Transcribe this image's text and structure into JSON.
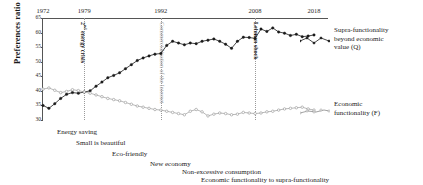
{
  "chart_data": {
    "type": "line",
    "title": "",
    "xlabel": "",
    "ylabel": "Preferences ratio (%)",
    "ylim": [
      30,
      65
    ],
    "xlim": [
      1972,
      2018
    ],
    "grid": false,
    "legend_position": "right",
    "yticks": [
      "65",
      "60",
      "55",
      "50",
      "45",
      "40",
      "35",
      "30"
    ],
    "ytick_values": [
      65,
      60,
      55,
      50,
      45,
      40,
      35,
      30
    ],
    "xticks": [
      "1972",
      "1979",
      "1992",
      "2008",
      "2018"
    ],
    "xtick_values": [
      1972,
      1979,
      1992,
      2008,
      2018
    ],
    "series": [
      {
        "name": "Supra-functionality beyond economic value (Q)",
        "symbol": "Q",
        "marker": "filled-circle",
        "color": "#1a1a1a",
        "x": [
          1972,
          1973,
          1974,
          1975,
          1976,
          1977,
          1978,
          1979,
          1980,
          1981,
          1982,
          1983,
          1984,
          1985,
          1986,
          1987,
          1988,
          1989,
          1990,
          1991,
          1992,
          1993,
          1994,
          1995,
          1996,
          1997,
          1998,
          1999,
          2000,
          2001,
          2002,
          2003,
          2004,
          2005,
          2006,
          2007,
          2008,
          2009,
          2010,
          2011,
          2012,
          2013,
          2014,
          2015,
          2016,
          2017,
          2018
        ],
        "values": [
          35.0,
          34.0,
          35.6,
          37.4,
          38.8,
          39.4,
          39.2,
          39.6,
          40.0,
          41.6,
          43.0,
          44.5,
          45.3,
          46.2,
          47.6,
          49.0,
          50.4,
          51.3,
          52.0,
          52.6,
          52.8,
          55.6,
          57.0,
          56.4,
          55.8,
          56.4,
          56.2,
          57.0,
          57.4,
          57.8,
          57.0,
          56.0,
          54.6,
          57.0,
          58.4,
          58.3,
          58.0,
          61.2,
          60.4,
          61.6,
          60.2,
          59.8,
          59.0,
          59.4,
          58.6,
          58.8,
          59.2
        ]
      },
      {
        "name": "Economic functionality (F)",
        "symbol": "F",
        "marker": "open-circle",
        "color": "#8a8a8a",
        "x": [
          1972,
          1973,
          1974,
          1975,
          1976,
          1977,
          1978,
          1979,
          1980,
          1981,
          1982,
          1983,
          1984,
          1985,
          1986,
          1987,
          1988,
          1989,
          1990,
          1991,
          1992,
          1993,
          1994,
          1995,
          1996,
          1997,
          1998,
          1999,
          2000,
          2001,
          2002,
          2003,
          2004,
          2005,
          2006,
          2007,
          2008,
          2009,
          2010,
          2011,
          2012,
          2013,
          2014,
          2015,
          2016,
          2017,
          2018
        ],
        "values": [
          40.6,
          41.0,
          40.2,
          39.4,
          39.8,
          40.4,
          40.1,
          39.6,
          39.2,
          38.6,
          38.0,
          37.4,
          37.0,
          36.6,
          36.0,
          35.4,
          34.8,
          34.4,
          34.0,
          33.6,
          33.4,
          33.0,
          32.6,
          32.2,
          31.8,
          33.0,
          33.6,
          32.8,
          31.4,
          32.0,
          32.4,
          32.2,
          31.8,
          32.0,
          32.6,
          32.4,
          32.2,
          32.4,
          32.8,
          33.0,
          33.4,
          33.8,
          34.0,
          34.2,
          34.4,
          33.8,
          33.4
        ]
      }
    ],
    "event_lines": [
      {
        "year": 1979,
        "label": "2nd energy crisis",
        "style": "bold-dark",
        "has_superscript": true,
        "sup": "nd",
        "pre": "2",
        "post": " energy crisis"
      },
      {
        "year": 1992,
        "label": "Commercialization of the Internet",
        "style": "grey",
        "has_superscript": false
      },
      {
        "year": 2008,
        "label": "Lehman shock",
        "style": "bold-dark",
        "has_superscript": false
      }
    ],
    "annotations": [
      {
        "text": "Energy saving"
      },
      {
        "text": "Small is beautiful"
      },
      {
        "text": "Eco-friendly"
      },
      {
        "text": "New economy"
      },
      {
        "text": "Non-excessive consumption"
      },
      {
        "text": "Economic functionality to supra-functionality"
      }
    ],
    "right_labels": [
      {
        "line1": "Supra-functionality",
        "line2": "beyond economic",
        "line3": "value (Q)"
      },
      {
        "line1": "Economic",
        "line2": "functionality (F)",
        "line3": ""
      }
    ]
  }
}
